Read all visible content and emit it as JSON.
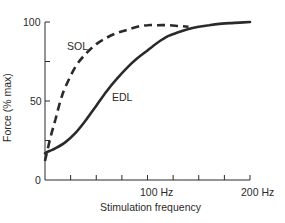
{
  "chart_data": {
    "type": "line",
    "title": "",
    "xlabel": "Stimulation frequency",
    "ylabel": "Force (% max)",
    "xlim": [
      0,
      200
    ],
    "ylim": [
      0,
      100
    ],
    "x_ticks": [
      0,
      25,
      50,
      75,
      100,
      125,
      150,
      175,
      200
    ],
    "x_tick_labels": [
      {
        "x": 100,
        "label": "100 Hz"
      },
      {
        "x": 200,
        "label": "200 Hz"
      }
    ],
    "y_ticks": [
      0,
      25,
      50,
      75,
      100
    ],
    "y_tick_labels": [
      {
        "y": 0,
        "label": "0"
      },
      {
        "y": 50,
        "label": "50"
      },
      {
        "y": 100,
        "label": "100"
      }
    ],
    "grid": false,
    "legend": "inline labels",
    "series": [
      {
        "name": "SOL",
        "style": "dashed",
        "x": [
          0,
          5,
          10,
          15,
          20,
          30,
          40,
          50,
          60,
          70,
          80,
          90,
          100,
          110,
          120,
          130,
          140
        ],
        "y": [
          12,
          26,
          38,
          50,
          59,
          72,
          80,
          86,
          90,
          93,
          95,
          97,
          98,
          98,
          98,
          97.5,
          97
        ]
      },
      {
        "name": "EDL",
        "style": "solid",
        "x": [
          0,
          5,
          10,
          20,
          30,
          40,
          50,
          60,
          70,
          80,
          90,
          100,
          110,
          120,
          130,
          140,
          150,
          160,
          170,
          180,
          190,
          200
        ],
        "y": [
          17,
          18.5,
          20,
          24,
          30,
          38,
          47,
          56,
          64,
          71,
          77,
          82,
          87,
          91,
          93.5,
          95.5,
          97,
          98,
          98.8,
          99.3,
          99.6,
          100
        ]
      }
    ],
    "annotations": [
      {
        "text": "SOL",
        "x": 38,
        "y": 85
      },
      {
        "text": "EDL",
        "x": 60,
        "y": 50
      }
    ]
  },
  "labels": {
    "y_axis": "Force (% max)",
    "x_axis": "Stimulation frequency",
    "y_tick_0": "0",
    "y_tick_50": "50",
    "y_tick_100": "100",
    "x_tick_100": "100 Hz",
    "x_tick_200": "200 Hz",
    "sol": "SOL",
    "edl": "EDL"
  },
  "colors": {
    "ink": "#2a2a2a",
    "background": "#ffffff"
  }
}
